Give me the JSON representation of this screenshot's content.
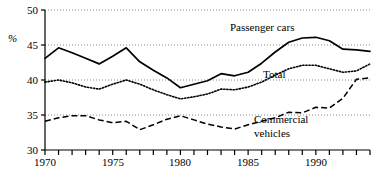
{
  "chart_data": {
    "type": "line",
    "title": "",
    "subtitle": "",
    "xlabel": "",
    "ylabel": "%",
    "ylim": [
      30,
      50
    ],
    "xlim": [
      1970,
      1994
    ],
    "yticks": [
      30,
      35,
      40,
      45,
      50
    ],
    "ytick_labels": [
      "30",
      "35",
      "40",
      "45",
      "50"
    ],
    "xticks": [
      1970,
      1975,
      1980,
      1985,
      1990
    ],
    "xtick_labels": [
      "1970",
      "1975",
      "1980",
      "1985",
      "1990"
    ],
    "x_minor_tick_interval": 1,
    "grid": "horizontal-dotted",
    "legend_position": "inline-annotations",
    "x": [
      1970,
      1971,
      1972,
      1973,
      1974,
      1975,
      1976,
      1977,
      1978,
      1979,
      1980,
      1981,
      1982,
      1983,
      1984,
      1985,
      1986,
      1987,
      1988,
      1989,
      1990,
      1991,
      1992,
      1993,
      1994
    ],
    "series": [
      {
        "name": "Passenger cars",
        "style": "solid",
        "label": "Passenger cars",
        "values": [
          43.1,
          44.6,
          43.9,
          43.1,
          42.3,
          43.4,
          44.6,
          42.6,
          41.4,
          40.3,
          38.9,
          39.4,
          39.9,
          40.9,
          40.6,
          41.1,
          42.4,
          44.0,
          45.4,
          46.0,
          46.1,
          45.6,
          44.4,
          44.3,
          44.1
        ],
        "annotation_text": "Passenger cars"
      },
      {
        "name": "Total",
        "style": "dotted",
        "label": "Total",
        "values": [
          39.7,
          40.0,
          39.6,
          39.0,
          38.7,
          39.4,
          40.0,
          39.4,
          38.6,
          37.9,
          37.3,
          37.6,
          38.0,
          38.7,
          38.6,
          39.0,
          39.7,
          40.7,
          41.6,
          42.1,
          42.1,
          41.6,
          41.1,
          41.3,
          42.3
        ],
        "annotation_text": "Total"
      },
      {
        "name": "Commercial vehicles",
        "style": "dashed",
        "label": "Commercial vehicles",
        "values": [
          34.1,
          34.6,
          34.9,
          34.9,
          34.3,
          33.9,
          34.1,
          32.9,
          33.6,
          34.4,
          34.9,
          34.3,
          33.7,
          33.3,
          33.0,
          33.6,
          34.1,
          34.6,
          35.4,
          35.3,
          36.1,
          36.0,
          37.4,
          40.1,
          40.3
        ],
        "annotation_text_line1": "Commercial",
        "annotation_text_line2": "vehicles"
      }
    ],
    "colors": {
      "line": "#000000",
      "axis": "#000000",
      "grid": "#999999",
      "background": "#ffffff"
    }
  },
  "annotations": {
    "passenger_cars": "Passenger cars",
    "total": "Total",
    "commercial_line1": "Commercial",
    "commercial_line2": "vehicles"
  },
  "axis": {
    "y_unit": "%"
  }
}
